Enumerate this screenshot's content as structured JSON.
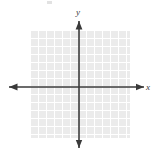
{
  "figure": {
    "kind": "cartesian-coordinate-plane",
    "background_color": "#ffffff",
    "axis_color": "#3a3a3a",
    "grid": {
      "fill_color": "#ebebeb",
      "line_color": "#ffffff",
      "cell_size_px": 8,
      "left_px": 30,
      "top_px": 30,
      "width_px": 100,
      "height_px": 108,
      "gridlines_visible": true
    },
    "axes": {
      "origin": {
        "x_px": 79,
        "y_px": 87
      },
      "x_axis": {
        "label": "x",
        "arrow_left": true,
        "arrow_right": true,
        "start_px": 9,
        "end_px": 144,
        "tick_labels": []
      },
      "y_axis": {
        "label": "y",
        "arrow_up": true,
        "arrow_down": true,
        "start_px": 21,
        "end_px": 148,
        "tick_labels": []
      }
    },
    "marks": {
      "corner_artifact": {
        "name": "faint-speck",
        "left_px": 47,
        "top_px": 1,
        "color": "#d8d8d8"
      }
    },
    "data_points": [],
    "curves": []
  }
}
